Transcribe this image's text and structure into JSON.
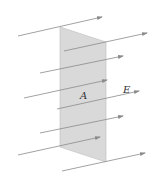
{
  "diagram": {
    "labels": {
      "area": "A",
      "field": "E"
    },
    "colors": {
      "plane": "#d9d9d9",
      "plane_edge": "#bdbdbd",
      "field_line": "#8a8a8a"
    },
    "plane": {
      "points": "60,27 106,42 106,162 60,147"
    },
    "field_lines": [
      {
        "x1": 18,
        "y1": 36,
        "x2": 102,
        "y2": 17
      },
      {
        "x1": 64,
        "y1": 51,
        "x2": 147,
        "y2": 33
      },
      {
        "x1": 40,
        "y1": 73,
        "x2": 123,
        "y2": 56
      },
      {
        "x1": 24,
        "y1": 98,
        "x2": 107,
        "y2": 80
      },
      {
        "x1": 57,
        "y1": 109,
        "x2": 139,
        "y2": 91
      },
      {
        "x1": 40,
        "y1": 133,
        "x2": 123,
        "y2": 116
      },
      {
        "x1": 18,
        "y1": 155,
        "x2": 100,
        "y2": 137
      },
      {
        "x1": 62,
        "y1": 171,
        "x2": 145,
        "y2": 153
      }
    ]
  }
}
